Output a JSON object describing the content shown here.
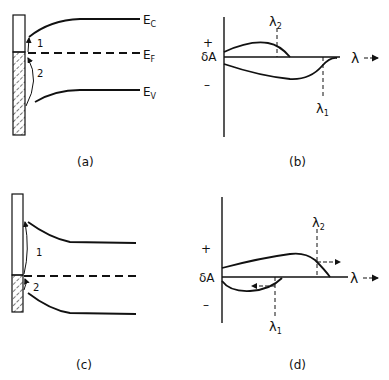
{
  "panels": {
    "a": {
      "caption": "(a)",
      "levels": {
        "conduction": "E",
        "conduction_sub": "C",
        "fermi": "E",
        "fermi_sub": "F",
        "valence": "E",
        "valence_sub": "V"
      },
      "transitions": [
        "1",
        "2"
      ]
    },
    "b": {
      "caption": "(b)",
      "y_label": "δA",
      "plus": "+",
      "minus": "–",
      "x_label": "λ",
      "markers": {
        "lambda2": "λ",
        "lambda2_sub": "2",
        "lambda1": "λ",
        "lambda1_sub": "1"
      }
    },
    "c": {
      "caption": "(c)",
      "transitions": [
        "1",
        "2"
      ]
    },
    "d": {
      "caption": "(d)",
      "y_label": "δA",
      "plus": "+",
      "minus": "–",
      "x_label": "λ",
      "markers": {
        "lambda2": "λ",
        "lambda2_sub": "2",
        "lambda1": "λ",
        "lambda1_sub": "1"
      }
    }
  },
  "colors": {
    "ink": "#111111",
    "background": "#ffffff"
  }
}
